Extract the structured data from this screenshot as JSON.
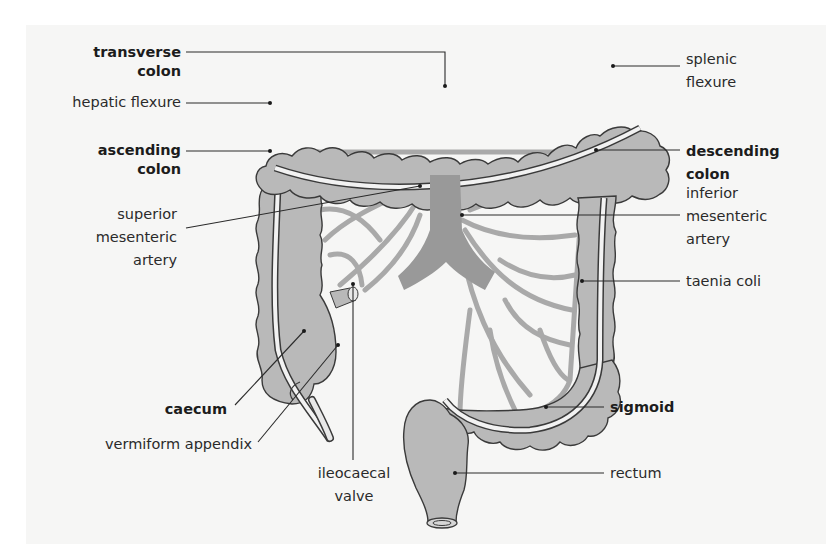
{
  "figure": {
    "colors": {
      "background": "#f6f6f5",
      "tissue_fill": "#b9b9b9",
      "tissue_outline": "#3a3a3a",
      "vessel": "#a9a9a9",
      "artery_trunk": "#999999",
      "leader_line": "#2a2a2a",
      "text": "#2a2a2a"
    },
    "labels_left": [
      {
        "id": "transverse-colon",
        "line1": "transverse",
        "line2": "colon",
        "bold": true
      },
      {
        "id": "hepatic-flexure",
        "line1": "hepatic flexure",
        "line2": "",
        "bold": false
      },
      {
        "id": "ascending-colon",
        "line1": "ascending",
        "line2": "colon",
        "bold": true
      },
      {
        "id": "superior-mesenteric-artery",
        "line1": "superior",
        "line2": "mesenteric",
        "line3": "artery",
        "bold": false
      }
    ],
    "labels_right": [
      {
        "id": "splenic-flexure",
        "line1": "splenic",
        "line2": "flexure",
        "bold": false
      },
      {
        "id": "descending-colon",
        "line1": "descending",
        "line2": "colon",
        "bold": true
      },
      {
        "id": "inferior-mesenteric-artery",
        "line1": "inferior",
        "line2": "mesenteric",
        "line3": "artery",
        "bold": false
      },
      {
        "id": "taenia-coli",
        "line1": "taenia coli",
        "bold": false
      },
      {
        "id": "sigmoid",
        "line1": "sigmoid",
        "bold": true
      },
      {
        "id": "rectum",
        "line1": "rectum",
        "bold": false
      }
    ],
    "labels_bottom": [
      {
        "id": "caecum",
        "line1": "caecum",
        "bold": true
      },
      {
        "id": "vermiform-appendix",
        "line1": "vermiform appendix",
        "bold": false
      },
      {
        "id": "ileocaecal-valve",
        "line1": "ileocaecal",
        "line2": "valve",
        "bold": false
      }
    ]
  }
}
